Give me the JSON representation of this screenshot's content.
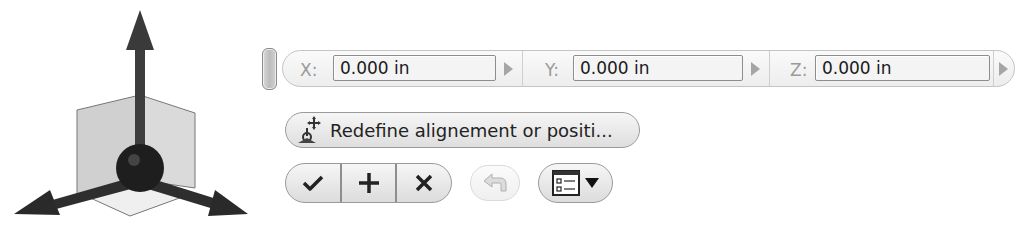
{
  "triad": {
    "icon": "3d-coordinate-triad-icon"
  },
  "toolbar": {
    "grip": {
      "icon": "drag-grip-icon"
    },
    "coordinates": [
      {
        "axis": "x",
        "label": "X:",
        "value": "0.000 in",
        "arrow_icon": "expand-arrow-icon"
      },
      {
        "axis": "y",
        "label": "Y:",
        "value": "0.000 in",
        "arrow_icon": "expand-arrow-icon"
      },
      {
        "axis": "z",
        "label": "Z:",
        "value": "0.000 in",
        "arrow_icon": "expand-arrow-icon"
      }
    ],
    "redefine": {
      "label": "Redefine alignement or positi...",
      "icon": "redefine-alignment-icon"
    },
    "actions": {
      "ok_icon": "checkmark-icon",
      "apply_icon": "plus-icon",
      "cancel_icon": "close-icon",
      "undo_icon": "undo-arrow-icon",
      "options_icon": "options-list-icon",
      "dropdown_icon": "dropdown-triangle-icon"
    }
  },
  "colors": {
    "bar_border": "#c4c4c4",
    "button_border": "#9a9a9a",
    "label_gray": "#9a9a9a",
    "triad_dark": "#3a3a3a",
    "plane_fill": "#d4d4d4"
  }
}
